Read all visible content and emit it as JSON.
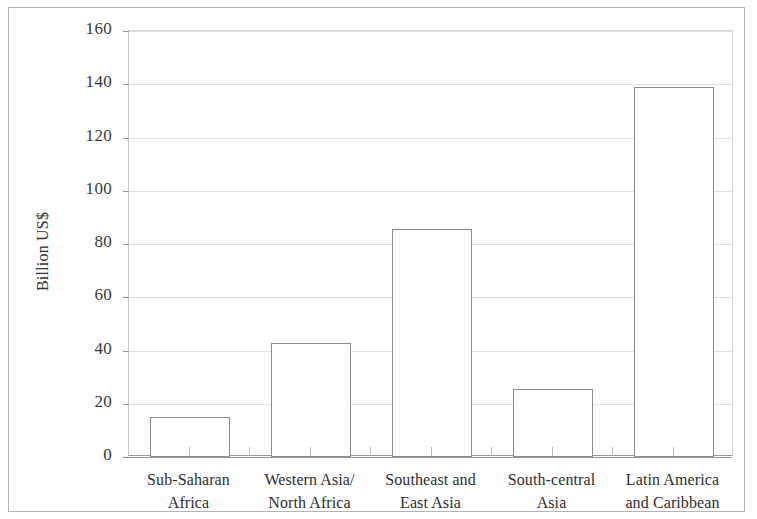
{
  "chart_data": {
    "type": "bar",
    "title": "",
    "subtitle": "",
    "xlabel": "",
    "ylabel": "Billion US$",
    "ylim": [
      0,
      160
    ],
    "ytick_step": 20,
    "yticks": [
      "0",
      "20",
      "40",
      "60",
      "80",
      "100",
      "120",
      "140",
      "160"
    ],
    "ytick_values": [
      0,
      20,
      40,
      60,
      80,
      100,
      120,
      140,
      160
    ],
    "grid": true,
    "grid_axis": "y",
    "legend": false,
    "legend_position": "none",
    "categories": [
      "Sub-Saharan Africa",
      "Western Asia/North Africa",
      "Southeast and East Asia",
      "South-central Asia",
      "Latin America and Caribbean"
    ],
    "category_lines": [
      [
        "Sub-Saharan",
        "Africa"
      ],
      [
        "Western Asia/",
        "North Africa"
      ],
      [
        "Southeast and",
        "East Asia"
      ],
      [
        "South-central",
        "Asia"
      ],
      [
        "Latin America",
        "and Caribbean"
      ]
    ],
    "values": [
      15,
      43,
      85.6,
      25.5,
      139
    ],
    "bar_fill": "#ffffff",
    "bar_edge": "#8d8d8d",
    "grid_color": "#e2e2e2",
    "axis_color": "#9a9a9a",
    "text_color": "#333333",
    "background": "#ffffff"
  }
}
